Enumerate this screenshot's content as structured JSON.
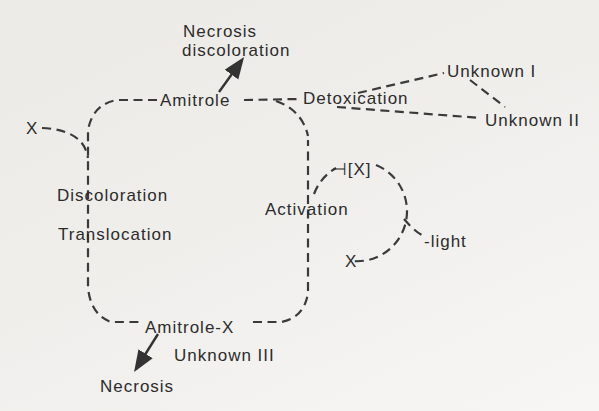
{
  "figure": {
    "type": "metabolic-pathway-diagram",
    "background_color": "#efeeeb",
    "line_color": "#3a3a3a",
    "text_color": "#2c2c2c",
    "labels": {
      "necrosis_discoloration_line1": "Necrosis",
      "necrosis_discoloration_line2": "discoloration",
      "amitrole": "Amitrole",
      "detoxication": "Detoxication",
      "unknown_i": "Unknown I",
      "unknown_ii": "Unknown II",
      "x_external": "X",
      "discoloration": "Discoloration",
      "translocation": "Translocation",
      "activation": "Activation",
      "x_bound": "⊣[X]",
      "light": "-light",
      "x_released": "X",
      "amitrole_x": "Amitrole-X",
      "unknown_iii": "Unknown III",
      "necrosis": "Necrosis"
    },
    "edges": [
      {
        "from": "Amitrole",
        "to": "Necrosis discoloration",
        "style": "solid-arrow"
      },
      {
        "from": "Amitrole",
        "to": "Detoxication",
        "style": "dashed"
      },
      {
        "from": "Detoxication",
        "to": "Unknown I",
        "style": "dashed"
      },
      {
        "from": "Detoxication",
        "to": "Unknown II",
        "style": "dashed"
      },
      {
        "from": "Unknown I",
        "to": "Unknown II",
        "style": "dashed"
      },
      {
        "from": "X",
        "to": "plant loop (left side)",
        "style": "dashed"
      },
      {
        "from": "Amitrole",
        "to": "Amitrole-X",
        "style": "dashed loop through Discoloration / Translocation / Activation"
      },
      {
        "from": "Activation",
        "to": "[X]",
        "style": "dashed cycle"
      },
      {
        "from": "light",
        "to": "activation cycle",
        "style": "dashed"
      },
      {
        "from": "activation cycle",
        "to": "X",
        "style": "dashed"
      },
      {
        "from": "Amitrole-X",
        "to": "Necrosis",
        "style": "solid-arrow"
      },
      {
        "from": "Amitrole-X",
        "to": "Unknown III",
        "style": "adjacent-label"
      }
    ]
  }
}
